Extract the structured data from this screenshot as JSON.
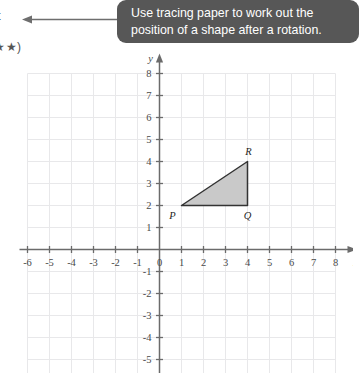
{
  "page": {
    "margin_text_top": "t",
    "margin_text_stars": "★★)"
  },
  "tooltip": {
    "line1": "Use tracing paper to work out the",
    "line2": "position of a shape after a rotation.",
    "background_color": "#575757",
    "text_color": "#ffffff"
  },
  "callout": {
    "arrow_direction": "left"
  },
  "chart_data": {
    "type": "scatter",
    "title": "",
    "xlabel": "x",
    "ylabel": "y",
    "xlim": [
      -6,
      8
    ],
    "ylim": [
      -6,
      8
    ],
    "grid": true,
    "legend": "none",
    "x_ticks": [
      -6,
      -5,
      -4,
      -3,
      -2,
      -1,
      0,
      1,
      2,
      3,
      4,
      5,
      6,
      7,
      8
    ],
    "y_ticks": [
      8,
      7,
      6,
      5,
      4,
      3,
      2,
      1,
      -1,
      -2,
      -3,
      -4,
      -5,
      -6
    ],
    "x_tick_labels": [
      "-6",
      "-5",
      "-4",
      "-3",
      "-2",
      "-1",
      "0",
      "1",
      "2",
      "3",
      "4",
      "5",
      "6",
      "7",
      "8"
    ],
    "y_tick_labels": [
      "8",
      "7",
      "6",
      "5",
      "4",
      "3",
      "2",
      "1",
      "-1",
      "-2",
      "-3",
      "-4",
      "-5",
      "-6"
    ],
    "origin_label": "0",
    "shapes": [
      {
        "name": "triangle-PQR",
        "type": "polygon",
        "fill": "#c9c9c9",
        "stroke": "#333333",
        "vertices": [
          {
            "label": "P",
            "x": 1,
            "y": 2
          },
          {
            "label": "Q",
            "x": 4,
            "y": 2
          },
          {
            "label": "R",
            "x": 4,
            "y": 4
          }
        ]
      }
    ],
    "vertex_labels": [
      "P",
      "Q",
      "R"
    ],
    "colors": {
      "grid_line": "#e8e8ea",
      "axis": "#6b6b6b",
      "tick_text": "#4a4a4a"
    }
  }
}
